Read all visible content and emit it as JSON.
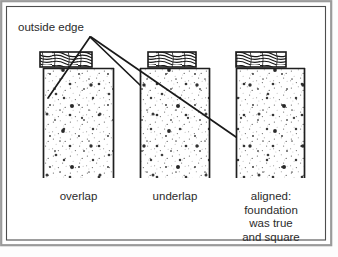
{
  "figure": {
    "title_label": "outside edge",
    "frame": {
      "outer_color": "#8e8e8e",
      "inner_color": "#4a4a4a",
      "background": "#ffffff"
    },
    "ink_color": "#1f1f1f",
    "callout": {
      "label": "outside edge",
      "leader_lines": 3
    },
    "panels": [
      {
        "id": "panel-overlap",
        "caption": "overlap",
        "caption_lines": [
          "overlap"
        ],
        "sill_plate": {
          "material": "wood",
          "x": 40,
          "width": 52,
          "alignment": "overhangs-outside"
        },
        "foundation": {
          "material": "concrete",
          "x": 43,
          "width": 71,
          "alignment": "inset"
        }
      },
      {
        "id": "panel-underlap",
        "caption": "underlap",
        "caption_lines": [
          "underlap"
        ],
        "sill_plate": {
          "material": "wood",
          "x": 148,
          "width": 48,
          "alignment": "inset-inside"
        },
        "foundation": {
          "material": "concrete",
          "x": 140,
          "width": 70,
          "alignment": "outside"
        }
      },
      {
        "id": "panel-aligned",
        "caption": "aligned: foundation was true and square",
        "caption_lines": [
          "aligned:",
          "foundation",
          "was true",
          "and square"
        ],
        "sill_plate": {
          "material": "wood",
          "x": 236,
          "width": 50,
          "alignment": "flush"
        },
        "foundation": {
          "material": "concrete",
          "x": 236,
          "width": 69,
          "alignment": "flush"
        }
      }
    ]
  }
}
